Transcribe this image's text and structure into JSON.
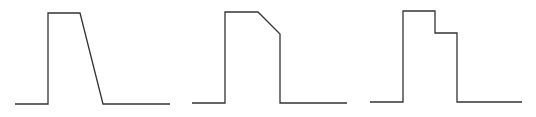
{
  "diagram": {
    "stroke_color": "#333333",
    "background": "#ffffff",
    "waveforms": [
      {
        "name": "trapezoid-pulse",
        "description": "Pulse with vertical rise, flat top, linear sloped fall",
        "points": [
          [
            15,
            104
          ],
          [
            48,
            104
          ],
          [
            48,
            13
          ],
          [
            80,
            13
          ],
          [
            103,
            104
          ],
          [
            170,
            104
          ]
        ]
      },
      {
        "name": "chamfered-pulse",
        "description": "Pulse with vertical rise, flat top, partial linear decay then vertical drop",
        "points": [
          [
            192,
            103
          ],
          [
            225,
            103
          ],
          [
            225,
            12
          ],
          [
            258,
            12
          ],
          [
            280,
            34
          ],
          [
            280,
            103
          ],
          [
            347,
            103
          ]
        ]
      },
      {
        "name": "stepped-pulse",
        "description": "Pulse with vertical rise, flat top, step down to lower level, then vertical drop",
        "points": [
          [
            370,
            102
          ],
          [
            403,
            102
          ],
          [
            403,
            11
          ],
          [
            435,
            11
          ],
          [
            435,
            33
          ],
          [
            457,
            33
          ],
          [
            457,
            102
          ],
          [
            522,
            102
          ]
        ]
      }
    ]
  }
}
